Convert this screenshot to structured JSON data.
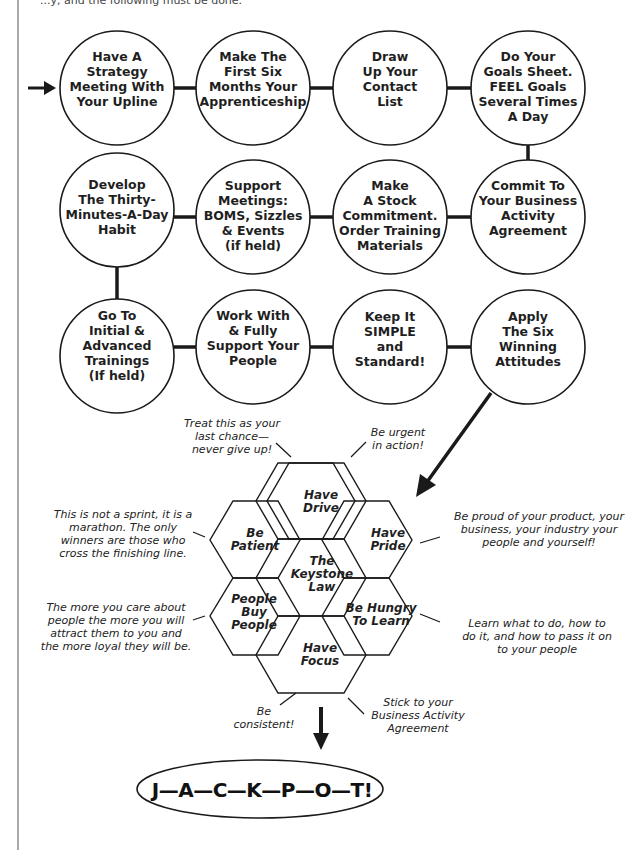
{
  "header": {
    "partial_text": "...y, and the following must be done."
  },
  "colors": {
    "stroke": "#1a1a1a",
    "background": "#ffffff"
  },
  "steps": [
    {
      "id": 1,
      "lines": [
        "Have A",
        "Strategy",
        "Meeting With",
        "Your Upline"
      ]
    },
    {
      "id": 2,
      "lines": [
        "Make The",
        "First Six",
        "Months Your",
        "Apprenticeship"
      ]
    },
    {
      "id": 3,
      "lines": [
        "Draw",
        "Up Your",
        "Contact",
        "List"
      ]
    },
    {
      "id": 4,
      "lines": [
        "Do Your",
        "Goals Sheet.",
        "FEEL Goals",
        "Several Times",
        "A Day"
      ]
    },
    {
      "id": 5,
      "lines": [
        "Commit To",
        "Your Business",
        "Activity",
        "Agreement"
      ]
    },
    {
      "id": 6,
      "lines": [
        "Make",
        "A Stock",
        "Commitment.",
        "Order Training",
        "Materials"
      ]
    },
    {
      "id": 7,
      "lines": [
        "Support",
        "Meetings:",
        "BOMS, Sizzles",
        "& Events",
        "(if held)"
      ]
    },
    {
      "id": 8,
      "lines": [
        "Develop",
        "The Thirty-",
        "Minutes-A-Day",
        "Habit"
      ]
    },
    {
      "id": 9,
      "lines": [
        "Go To",
        "Initial &",
        "Advanced",
        "Trainings",
        "(If held)"
      ]
    },
    {
      "id": 10,
      "lines": [
        "Work With",
        "& Fully",
        "Support Your",
        "People"
      ]
    },
    {
      "id": 11,
      "lines": [
        "Keep It",
        "SIMPLE",
        "and",
        "Standard!"
      ]
    },
    {
      "id": 12,
      "lines": [
        "Apply",
        "The Six",
        "Winning",
        "Attitudes"
      ]
    }
  ],
  "hexagons": [
    {
      "name": "have-drive",
      "lines": [
        "Have",
        "Drive"
      ]
    },
    {
      "name": "be-patient",
      "lines": [
        "Be",
        "Patient"
      ]
    },
    {
      "name": "have-pride",
      "lines": [
        "Have",
        "Pride"
      ]
    },
    {
      "name": "keystone-law",
      "lines": [
        "The",
        "Keystone",
        "Law"
      ]
    },
    {
      "name": "people-buy-people",
      "lines": [
        "People",
        "Buy",
        "People"
      ]
    },
    {
      "name": "be-hungry",
      "lines": [
        "Be Hungry",
        "To Learn"
      ]
    },
    {
      "name": "have-focus",
      "lines": [
        "Have",
        "Focus"
      ]
    }
  ],
  "notes": {
    "last_chance": [
      "Treat this as your",
      "last chance—",
      "never give up!"
    ],
    "urgent": [
      "Be urgent",
      "in action!"
    ],
    "sprint": [
      "This is not a sprint, it is a",
      "marathon. The only",
      "winners are those who",
      "cross the finishing line."
    ],
    "proud": [
      "Be proud of your product, your",
      "business, your industry your",
      "people and yourself!"
    ],
    "care": [
      "The more you care about",
      "people the more you will",
      "attract them to you and",
      "the more loyal they will be."
    ],
    "learn": [
      "Learn what to do, how to",
      "do it, and how to pass it on",
      "to your people"
    ],
    "consistent": [
      "Be",
      "consistent!"
    ],
    "stick": [
      "Stick to your",
      "Business Activity",
      "Agreement"
    ]
  },
  "jackpot": {
    "label": "J—A—C—K—P—O—T!"
  }
}
